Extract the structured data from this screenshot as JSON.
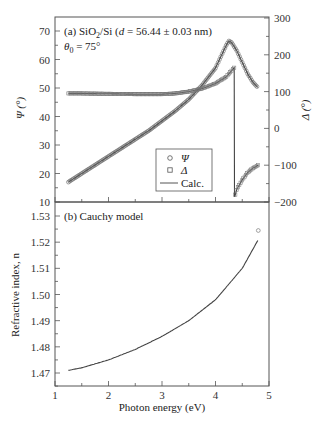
{
  "chart_data": [
    {
      "type": "scatter",
      "panel": "(a)",
      "title": "(a) SiO2/Si (d = 56.44 ± 0.03 nm)",
      "annotation": "θ0 = 75°",
      "xlabel": "Photon energy (eV)",
      "ylabel_left": "Ψ (°)",
      "ylabel_right": "Δ (°)",
      "xlim": [
        1,
        5
      ],
      "ylim_left": [
        10,
        70
      ],
      "ylim_right": [
        -200,
        300
      ],
      "yticks_left": [
        10,
        20,
        30,
        40,
        50,
        60,
        70
      ],
      "yticks_right": [
        -200,
        -100,
        0,
        100,
        200,
        300
      ],
      "legend": [
        "Ψ",
        "Δ",
        "Calc."
      ],
      "legend_position": "lower right",
      "series": [
        {
          "name": "Ψ",
          "marker": "circle",
          "axis": "left",
          "x": [
            1.25,
            1.5,
            1.75,
            2.0,
            2.25,
            2.5,
            2.75,
            3.0,
            3.25,
            3.5,
            3.75,
            4.0,
            4.1,
            4.2,
            4.25,
            4.3,
            4.4,
            4.5,
            4.6,
            4.7,
            4.8
          ],
          "y": [
            17,
            20,
            23,
            26,
            29,
            32,
            35,
            38.5,
            42,
            46,
            51,
            57,
            61,
            65,
            66.5,
            66,
            63,
            59,
            55,
            52,
            50
          ]
        },
        {
          "name": "Δ",
          "marker": "square",
          "axis": "right",
          "x": [
            1.25,
            1.5,
            2.0,
            2.5,
            3.0,
            3.25,
            3.5,
            3.75,
            4.0,
            4.2,
            4.35,
            4.36,
            4.4,
            4.5,
            4.6,
            4.7,
            4.8
          ],
          "y": [
            95,
            95,
            94,
            93,
            93,
            95,
            100,
            108,
            122,
            140,
            165,
            -185,
            -165,
            -140,
            -120,
            -108,
            -100
          ]
        }
      ]
    },
    {
      "type": "line",
      "panel": "(b)",
      "title": "(b) Cauchy model",
      "xlabel": "Photon energy (eV)",
      "ylabel": "Refractive index, n",
      "xlim": [
        1,
        5
      ],
      "ylim": [
        1.465,
        1.535
      ],
      "xticks": [
        1,
        2,
        3,
        4,
        5
      ],
      "yticks": [
        1.47,
        1.48,
        1.49,
        1.5,
        1.51,
        1.52,
        1.53
      ],
      "x": [
        1.25,
        1.5,
        2.0,
        2.5,
        3.0,
        3.5,
        4.0,
        4.5,
        4.8
      ],
      "y": [
        1.471,
        1.472,
        1.475,
        1.479,
        1.484,
        1.49,
        1.498,
        1.51,
        1.521
      ]
    }
  ],
  "labels": {
    "panel_a_title": "(a) SiO",
    "panel_a_sub": "2",
    "panel_a_rest": "/Si (",
    "panel_a_d": "d",
    "panel_a_value": " = 56.44 ± 0.03 nm)",
    "theta": "θ",
    "theta_sub": "0",
    "theta_value": " = 75°",
    "psi_axis": "Ψ (°)",
    "delta_axis": "Δ (°)",
    "legend_psi": "Ψ",
    "legend_delta": "Δ",
    "legend_calc": "Calc.",
    "panel_b_title": "(b) Cauchy model",
    "n_axis": "Refractive index, n",
    "x_axis": "Photon energy (eV)",
    "xticks": [
      "1",
      "2",
      "3",
      "4",
      "5"
    ],
    "psi_ticks": [
      "70",
      "60",
      "50",
      "40",
      "30",
      "20",
      "10"
    ],
    "delta_ticks": [
      "300",
      "200",
      "100",
      "0",
      "−100",
      "−200"
    ],
    "n_ticks": [
      "1.53",
      "1.52",
      "1.51",
      "1.50",
      "1.49",
      "1.48",
      "1.47"
    ]
  }
}
